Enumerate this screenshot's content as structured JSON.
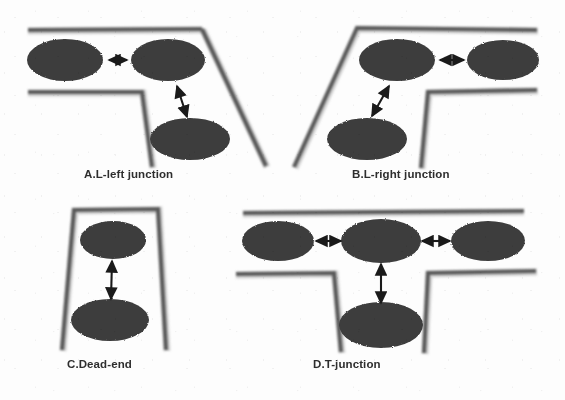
{
  "figure": {
    "background_color": "#fdfdfd",
    "wall_color": "#5a5a5a",
    "node_color": "#3c3c3c",
    "arrow_color": "#1a1a1a",
    "caption_color": "#2e2e2e"
  },
  "panels": [
    {
      "id": "A",
      "caption": "A.L-left junction",
      "node_count": 3,
      "arrow_count": 2,
      "nodes": [
        {
          "name": "node-a-left",
          "cx": 65,
          "cy": 60,
          "rx": 38,
          "ry": 21
        },
        {
          "name": "node-a-right",
          "cx": 168,
          "cy": 60,
          "rx": 37,
          "ry": 21
        },
        {
          "name": "node-a-bottom",
          "cx": 190,
          "cy": 139,
          "rx": 40,
          "ry": 21
        }
      ],
      "arrows": [
        {
          "name": "arrow-a-horizontal",
          "x1": 110,
          "y1": 60,
          "x2": 126,
          "y2": 60
        },
        {
          "name": "arrow-a-diagonal",
          "x1": 176,
          "y1": 85,
          "x2": 186,
          "y2": 115
        }
      ]
    },
    {
      "id": "B",
      "caption": "B.L-right junction",
      "node_count": 3,
      "arrow_count": 2,
      "nodes": [
        {
          "name": "node-b-center",
          "cx": 397,
          "cy": 60,
          "rx": 38,
          "ry": 21
        },
        {
          "name": "node-b-right",
          "cx": 503,
          "cy": 60,
          "rx": 36,
          "ry": 20
        },
        {
          "name": "node-b-bottom",
          "cx": 367,
          "cy": 139,
          "rx": 40,
          "ry": 21
        }
      ],
      "arrows": [
        {
          "name": "arrow-b-horizontal",
          "x1": 441,
          "y1": 60,
          "x2": 462,
          "y2": 60
        },
        {
          "name": "arrow-b-diagonal",
          "x1": 388,
          "y1": 86,
          "x2": 373,
          "y2": 114
        }
      ]
    },
    {
      "id": "C",
      "caption": "C.Dead-end",
      "node_count": 2,
      "arrow_count": 1,
      "nodes": [
        {
          "name": "node-c-top",
          "cx": 113,
          "cy": 240,
          "rx": 33,
          "ry": 19
        },
        {
          "name": "node-c-bottom",
          "cx": 110,
          "cy": 320,
          "rx": 39,
          "ry": 21
        }
      ],
      "arrows": [
        {
          "name": "arrow-c-vertical",
          "x1": 112,
          "y1": 262,
          "x2": 111,
          "y2": 297
        }
      ]
    },
    {
      "id": "D",
      "caption": "D.T-junction",
      "node_count": 4,
      "arrow_count": 3,
      "nodes": [
        {
          "name": "node-d-left",
          "cx": 278,
          "cy": 241,
          "rx": 36,
          "ry": 20
        },
        {
          "name": "node-d-center",
          "cx": 381,
          "cy": 241,
          "rx": 40,
          "ry": 22
        },
        {
          "name": "node-d-right",
          "cx": 488,
          "cy": 241,
          "rx": 37,
          "ry": 20
        },
        {
          "name": "node-d-bottom",
          "cx": 381,
          "cy": 325,
          "rx": 42,
          "ry": 23
        }
      ],
      "arrows": [
        {
          "name": "arrow-d-left",
          "x1": 317,
          "y1": 241,
          "x2": 339,
          "y2": 241
        },
        {
          "name": "arrow-d-right",
          "x1": 423,
          "y1": 241,
          "x2": 449,
          "y2": 241
        },
        {
          "name": "arrow-d-vertical",
          "x1": 381,
          "y1": 265,
          "x2": 381,
          "y2": 301
        }
      ]
    }
  ],
  "walls": {
    "panel_a": [
      {
        "name": "wall-a-outer-top",
        "points": "28,30 202,29"
      },
      {
        "name": "wall-a-outer-diagonal",
        "points": "202,29 266,166"
      },
      {
        "name": "wall-a-inner-top",
        "points": "28,92 142,92"
      },
      {
        "name": "wall-a-inner-vertical",
        "points": "142,92 152,167"
      }
    ],
    "panel_b": [
      {
        "name": "wall-b-outer-diagonal",
        "points": "357,28 294,167"
      },
      {
        "name": "wall-b-outer-top",
        "points": "357,28 537,30"
      },
      {
        "name": "wall-b-inner-vertical",
        "points": "428,92 421,168"
      },
      {
        "name": "wall-b-inner-top",
        "points": "428,92 537,90"
      }
    ],
    "panel_c": [
      {
        "name": "wall-c-left",
        "points": "74,210 62,350"
      },
      {
        "name": "wall-c-top",
        "points": "74,210 158,209"
      },
      {
        "name": "wall-c-right",
        "points": "158,209 166,350"
      }
    ],
    "panel_d": [
      {
        "name": "wall-d-top",
        "points": "243,213 524,211"
      },
      {
        "name": "wall-d-left-horizontal",
        "points": "236,274 334,273"
      },
      {
        "name": "wall-d-left-vertical",
        "points": "334,273 341,352"
      },
      {
        "name": "wall-d-right-vertical",
        "points": "428,273 424,353"
      },
      {
        "name": "wall-d-right-horizontal",
        "points": "428,273 536,271"
      }
    ]
  }
}
